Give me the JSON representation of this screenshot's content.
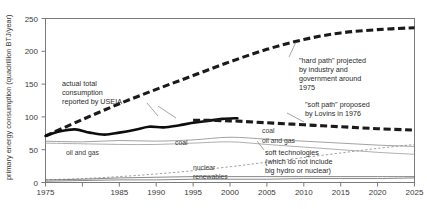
{
  "chart_data": {
    "type": "line",
    "title": "",
    "xlabel": "",
    "ylabel": "primary energy consumption (quadrillion BTJ/year)",
    "xlim": [
      1975,
      2025
    ],
    "ylim": [
      0,
      250
    ],
    "yticks": [
      0,
      50,
      100,
      150,
      200,
      250
    ],
    "xticks": [
      1975,
      1980,
      1985,
      1990,
      1995,
      2000,
      2005,
      2010,
      2015,
      2020,
      2025
    ],
    "xtick_labels": [
      "1975",
      "",
      "1985",
      "1990",
      "1995",
      "2000",
      "2005",
      "2010",
      "2015",
      "2020",
      "2025"
    ],
    "ytick_labels": [
      "0",
      "50",
      "100",
      "150",
      "200",
      "250"
    ],
    "grid": false,
    "legend": "inline-labels",
    "series": [
      {
        "name": "hard path",
        "style": "thick-dashed",
        "color": "#1a1a1a",
        "x": [
          1975,
          1980,
          1985,
          1990,
          1995,
          2000,
          2005,
          2010,
          2015,
          2020,
          2025
        ],
        "values": [
          71,
          96,
          120,
          142,
          163,
          184,
          203,
          218,
          228,
          233,
          236
        ]
      },
      {
        "name": "actual total consumption reported by USEIA",
        "style": "thick-solid",
        "color": "#0d0d0d",
        "x": [
          1975,
          1977,
          1979,
          1981,
          1983,
          1985,
          1987,
          1989,
          1991,
          1993,
          1995,
          1997,
          1999,
          2001
        ],
        "values": [
          71,
          78,
          81,
          76,
          73,
          76,
          80,
          85,
          84,
          87,
          91,
          94,
          97,
          98
        ]
      },
      {
        "name": "soft path",
        "style": "thick-dashed",
        "color": "#1a1a1a",
        "x": [
          1995,
          2000,
          2005,
          2010,
          2015,
          2020,
          2025
        ],
        "values": [
          95,
          94,
          91,
          88,
          85,
          82,
          80
        ]
      },
      {
        "name": "coal",
        "style": "thin-solid",
        "color": "#8a8a8a",
        "x": [
          1975,
          1980,
          1985,
          1990,
          1995,
          2000,
          2005,
          2010,
          2015,
          2020,
          2025
        ],
        "values": [
          63,
          62,
          64,
          63,
          65,
          69,
          66,
          63,
          60,
          57,
          55
        ]
      },
      {
        "name": "oil and gas",
        "style": "thin-solid",
        "color": "#9a9a9a",
        "x": [
          1975,
          1980,
          1985,
          1990,
          1995,
          2000,
          2005,
          2010,
          2015,
          2020,
          2025
        ],
        "values": [
          60,
          59,
          58,
          58,
          60,
          62,
          58,
          54,
          50,
          46,
          43
        ]
      },
      {
        "name": "soft technologies",
        "style": "thin-dashed",
        "color": "#8a8a8a",
        "x": [
          1975,
          1980,
          1985,
          1990,
          1995,
          2000,
          2005,
          2010,
          2015,
          2020,
          2025
        ],
        "values": [
          4,
          6,
          9,
          13,
          18,
          24,
          31,
          38,
          45,
          52,
          58
        ]
      },
      {
        "name": "nuclear",
        "style": "thin-solid",
        "color": "#6a6a6a",
        "x": [
          1975,
          1980,
          1985,
          1990,
          1995,
          2000,
          2005,
          2010,
          2015,
          2020,
          2025
        ],
        "values": [
          4,
          5,
          7,
          8,
          9,
          9,
          9,
          9,
          9,
          9,
          9
        ]
      },
      {
        "name": "renewables",
        "style": "thin-solid",
        "color": "#6a6a6a",
        "x": [
          1975,
          1980,
          1985,
          1990,
          1995,
          2000,
          2005,
          2010,
          2015,
          2020,
          2025
        ],
        "values": [
          2,
          3,
          4,
          4,
          5,
          5,
          5,
          6,
          6,
          6,
          7
        ]
      }
    ],
    "annotations": [
      {
        "id": "actual-total",
        "lines": [
          "actual total",
          "consumption",
          "reported by USEIA"
        ]
      },
      {
        "id": "hard-path",
        "lines": [
          "\"hard path\" projected",
          "by industry and",
          "government around",
          "1975"
        ]
      },
      {
        "id": "soft-path",
        "lines": [
          "\"soft path\" proposed",
          "by Lovins in 1976"
        ]
      },
      {
        "id": "soft-technologies",
        "lines": [
          "soft technologies",
          "(which do not include",
          "big hydro or nuclear)"
        ]
      }
    ],
    "series_labels": [
      {
        "id": "oil-and-gas-left",
        "text": "oil and gas"
      },
      {
        "id": "coal-left",
        "text": "coal"
      },
      {
        "id": "coal-right",
        "text": "coal"
      },
      {
        "id": "oil-and-gas-right",
        "text": "oil and gas"
      },
      {
        "id": "nuclear",
        "text": "nuclear"
      },
      {
        "id": "renewables",
        "text": "renewables"
      }
    ]
  },
  "axis": {
    "y_title": "primary energy consumption (quadrillion BTJ/year)",
    "yticks": [
      "250",
      "200",
      "150",
      "100",
      "50",
      "0"
    ],
    "xticks": [
      "1975",
      "1985",
      "1990",
      "1995",
      "2000",
      "2005",
      "2010",
      "2015",
      "2020",
      "2025"
    ]
  },
  "annotation_text": {
    "actual_l1": "actual total",
    "actual_l2": "consumption",
    "actual_l3": "reported by USEIA",
    "hard_l1": "\"hard path\" projected",
    "hard_l2": "by industry and",
    "hard_l3": "government around",
    "hard_l4": "1975",
    "soft_l1": "\"soft path\" proposed",
    "soft_l2": "by Lovins in 1976",
    "tech_l1": "soft technologies",
    "tech_l2": "(which do not include",
    "tech_l3": "big hydro or nuclear)"
  },
  "series_text": {
    "oil_gas_left": "oil and gas",
    "coal_left": "coal",
    "coal_right": "coal",
    "oil_gas_right": "oil and gas",
    "nuclear": "nuclear",
    "renewables": "renewables"
  },
  "colors": {
    "axis": "#6e6e6e",
    "text": "#3a3a3a",
    "hard_path": "#1a1a1a",
    "soft_path": "#1a1a1a",
    "actual": "#0d0d0d",
    "coal": "#8a8a8a",
    "oil_gas": "#9a9a9a",
    "soft_tech": "#8a8a8a",
    "nuclear": "#6a6a6a",
    "renewables": "#6a6a6a"
  }
}
